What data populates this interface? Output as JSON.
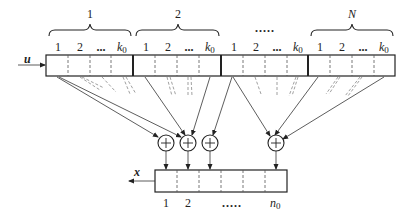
{
  "diagram": {
    "type": "convolutional-encoder",
    "input_label": "u",
    "output_label": "x",
    "input_register": {
      "groups": [
        {
          "label": "1",
          "cells": [
            "1",
            "2",
            "...",
            "k0"
          ]
        },
        {
          "label": "2",
          "cells": [
            "1",
            "2",
            "...",
            "k0"
          ]
        },
        {
          "label": ".....",
          "cells": [
            "1",
            "2",
            "...",
            "k0"
          ]
        },
        {
          "label": "N",
          "cells": [
            "1",
            "2",
            "...",
            "k0"
          ]
        }
      ],
      "group_ellipsis": "....."
    },
    "adders": {
      "symbol": "+",
      "count_visible": 4
    },
    "output_register": {
      "cell_labels": [
        "1",
        "2",
        ".....",
        "n0"
      ]
    }
  },
  "labels": {
    "g1": "1",
    "g2": "2",
    "g3": ".....",
    "gN": "N",
    "c1": "1",
    "c2": "2",
    "cdots": "...",
    "k": "k",
    "k_sub": "0",
    "u": "u",
    "x": "x",
    "o1": "1",
    "o2": "2",
    "odots": ".....",
    "n": "n",
    "n_sub": "0",
    "plus": "+"
  }
}
